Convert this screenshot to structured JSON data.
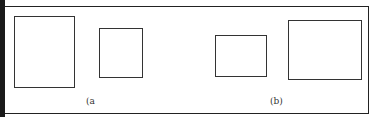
{
  "figure": {
    "panels": [
      {
        "label": "(a",
        "rectangles": [
          {
            "name": "tall-rectangle",
            "x": 14,
            "y": 16,
            "w": 61,
            "h": 72
          },
          {
            "name": "small-rectangle",
            "x": 99,
            "y": 28,
            "w": 44,
            "h": 50
          }
        ]
      },
      {
        "label": "(b)",
        "rectangles": [
          {
            "name": "small-rectangle",
            "x": 215,
            "y": 35,
            "w": 52,
            "h": 42
          },
          {
            "name": "wide-rectangle",
            "x": 288,
            "y": 20,
            "w": 74,
            "h": 60
          }
        ]
      }
    ]
  }
}
